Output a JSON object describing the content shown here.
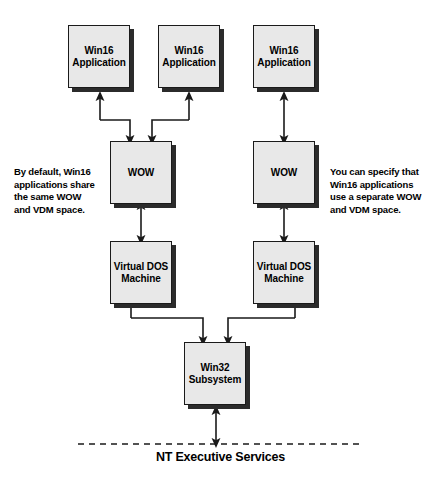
{
  "diagram": {
    "nodes": {
      "app1": {
        "label": "Win16\nApplication"
      },
      "app2": {
        "label": "Win16\nApplication"
      },
      "app3": {
        "label": "Win16\nApplication"
      },
      "wow_shared": {
        "label": "WOW"
      },
      "wow_separate": {
        "label": "WOW"
      },
      "vdm_shared": {
        "label": "Virtual DOS\nMachine"
      },
      "vdm_separate": {
        "label": "Virtual DOS\nMachine"
      },
      "win32": {
        "label": "Win32\nSubsystem"
      }
    },
    "annotations": {
      "left": {
        "line1": "By default, Win16",
        "line2": "applications share",
        "line3": "the same  WOW",
        "line4": "and VDM space."
      },
      "right": {
        "line1": "You can specify that",
        "line2": "Win16 applications",
        "line3_pre": "use a ",
        "line3_em": "separate",
        "line3_post": " WOW",
        "line4": "and VDM space."
      }
    },
    "footer": {
      "label": "NT Executive Services"
    },
    "colors": {
      "box_fill": "#e8e8e8",
      "box_border": "#1a1a1a",
      "box_shadow": "#2b2b2b",
      "line": "#1a1a1a",
      "background": "#ffffff"
    }
  }
}
